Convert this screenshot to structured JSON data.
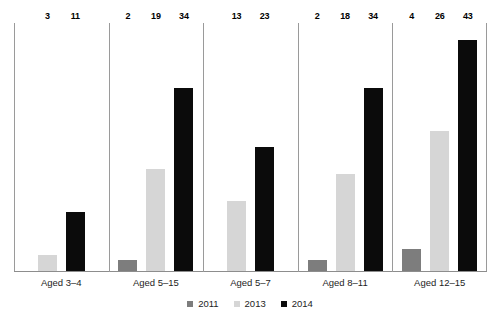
{
  "chart_data": {
    "type": "bar",
    "title": "",
    "subtitle": "",
    "xlabel": "",
    "ylabel": "",
    "ylim": [
      0,
      45
    ],
    "grid": false,
    "legend_position": "bottom-center",
    "categories": [
      "Aged 3–4",
      "Aged 5–15",
      "Aged 5–7",
      "Aged 8–11",
      "Aged 12–15"
    ],
    "series": [
      {
        "name": "2011",
        "color": "#7d7d7d",
        "values": [
          null,
          2,
          null,
          2,
          4
        ]
      },
      {
        "name": "2013",
        "color": "#d6d6d6",
        "values": [
          3,
          19,
          13,
          18,
          26
        ]
      },
      {
        "name": "2014",
        "color": "#0b0b0b",
        "values": [
          11,
          34,
          23,
          34,
          43
        ]
      }
    ],
    "data_labels": {
      "Aged 3–4": [
        {
          "series": "2013",
          "value": "3"
        },
        {
          "series": "2014",
          "value": "11"
        }
      ],
      "Aged 5–15": [
        {
          "series": "2011",
          "value": "2"
        },
        {
          "series": "2013",
          "value": "19"
        },
        {
          "series": "2014",
          "value": "34"
        }
      ],
      "Aged 5–7": [
        {
          "series": "2013",
          "value": "13"
        },
        {
          "series": "2014",
          "value": "23"
        }
      ],
      "Aged 8–11": [
        {
          "series": "2011",
          "value": "2"
        },
        {
          "series": "2013",
          "value": "18"
        },
        {
          "series": "2014",
          "value": "34"
        }
      ],
      "Aged 12–15": [
        {
          "series": "2011",
          "value": "4"
        },
        {
          "series": "2013",
          "value": "26"
        },
        {
          "series": "2014",
          "value": "43"
        }
      ]
    }
  },
  "axis": {
    "category_labels": [
      "Aged 3–4",
      "Aged 5–15",
      "Aged 5–7",
      "Aged 8–11",
      "Aged 12–15"
    ]
  },
  "legend": {
    "items": [
      {
        "label": "2011",
        "swatch": "series-2011-swatch"
      },
      {
        "label": "2013",
        "swatch": "series-2013-swatch"
      },
      {
        "label": "2014",
        "swatch": "series-2014-swatch"
      }
    ]
  },
  "colors": {
    "series_2011": "#7d7d7d",
    "series_2013": "#d6d6d6",
    "series_2014": "#0b0b0b",
    "axis": "#9a9a9a",
    "text": "#1d1d1d",
    "background": "#ffffff"
  }
}
